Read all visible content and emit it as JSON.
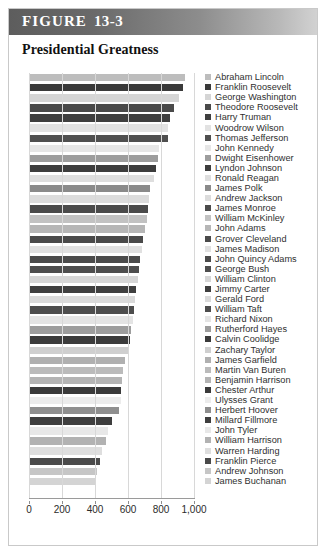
{
  "figure": {
    "label_caps": "FIGURE",
    "label_word": "F",
    "number": "13-3",
    "title": "Presidential Greatness"
  },
  "colors": {
    "header_dark": "#5d5d5d",
    "header_light": "#d2d2d2",
    "frame_border": "#c9c9c9",
    "gridline": "#d8d8d8",
    "axis": "#9a9a9a",
    "text": "#2f2f2f"
  },
  "chart_data": {
    "type": "bar",
    "orientation": "horizontal",
    "title": "Presidential Greatness",
    "xlabel": "",
    "ylabel": "",
    "xlim": [
      0,
      1000
    ],
    "grid": true,
    "legend_position": "right",
    "xticks": [
      0,
      200,
      400,
      600,
      800,
      1000
    ],
    "xtick_labels": [
      "0",
      "200",
      "400",
      "600",
      "800",
      "1,000"
    ],
    "categories": [
      "Abraham Lincoln",
      "Franklin Roosevelt",
      "George Washington",
      "Theodore Roosevelt",
      "Harry Truman",
      "Woodrow Wilson",
      "Thomas Jefferson",
      "John Kennedy",
      "Dwight Eisenhower",
      "Lyndon Johnson",
      "Ronald Reagan",
      "James Polk",
      "Andrew Jackson",
      "James Monroe",
      "William McKinley",
      "John Adams",
      "Grover Cleveland",
      "James Madison",
      "John Quincy Adams",
      "George Bush",
      "William Clinton",
      "Jimmy Carter",
      "Gerald Ford",
      "William Taft",
      "Richard Nixon",
      "Rutherford Hayes",
      "Calvin Coolidge",
      "Zachary Taylor",
      "James Garfield",
      "Martin Van Buren",
      "Benjamin Harrison",
      "Chester Arthur",
      "Ulysses Grant",
      "Herbert Hoover",
      "Millard Fillmore",
      "John Tyler",
      "William Harrison",
      "Warren Harding",
      "Franklin Pierce",
      "Andrew Johnson",
      "James Buchanan"
    ],
    "values": [
      945,
      935,
      910,
      880,
      855,
      845,
      840,
      790,
      780,
      770,
      755,
      735,
      725,
      720,
      715,
      700,
      690,
      685,
      675,
      665,
      660,
      650,
      640,
      635,
      630,
      620,
      610,
      600,
      580,
      570,
      565,
      560,
      555,
      545,
      500,
      480,
      465,
      440,
      430,
      415,
      400
    ],
    "bar_colors": [
      "#bdbdbd",
      "#3a3a3a",
      "#d5d5d5",
      "#4a4a4a",
      "#3f3f3f",
      "#e2e2e2",
      "#4f4f4f",
      "#e6e6e6",
      "#9d9d9d",
      "#3d3d3d",
      "#dedede",
      "#8a8a8a",
      "#dcdcdc",
      "#4b4b4b",
      "#c2c2c2",
      "#b6b6b6",
      "#4a4a4a",
      "#e0e0e0",
      "#4b4b4b",
      "#4e4e4e",
      "#d6d6d6",
      "#3f3f3f",
      "#dadada",
      "#4d4d4d",
      "#e4e4e4",
      "#9d9d9d",
      "#3b3b3b",
      "#cfcfcf",
      "#b0b0b0",
      "#bbbbbb",
      "#b4b4b4",
      "#3a3a3a",
      "#ececec",
      "#8f8f8f",
      "#3e3e3e",
      "#e8e8e8",
      "#b2b2b2",
      "#dedede",
      "#4a4a4a",
      "#c6c6c6",
      "#d4d4d4"
    ]
  }
}
